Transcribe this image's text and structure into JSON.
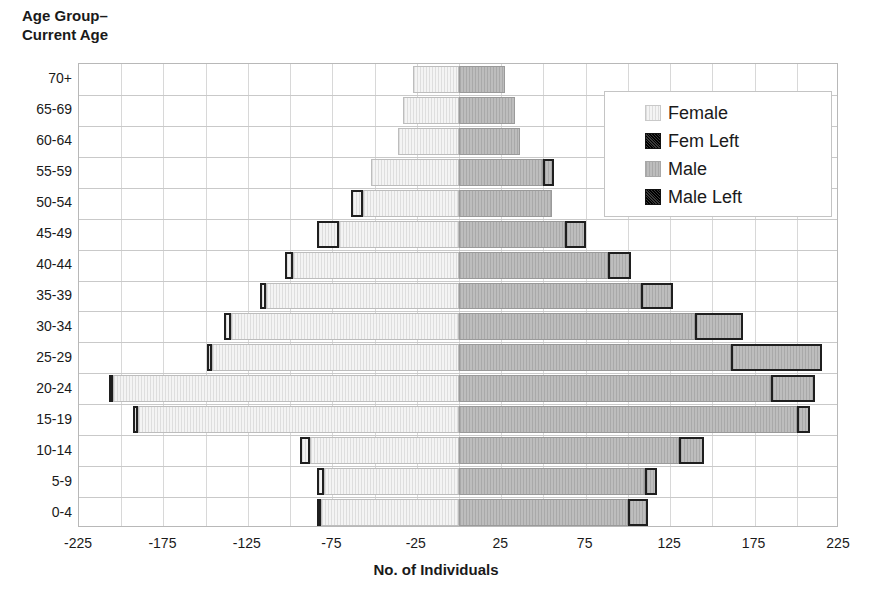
{
  "chart_data": {
    "type": "bar",
    "subtype": "population-pyramid",
    "title": "",
    "xlabel": "No. of Individuals",
    "ylabel": "Age Group–\nCurrent Age",
    "orientation": "horizontal",
    "grid": true,
    "legend_position": "top-right",
    "xlim": [
      -225,
      225
    ],
    "xticks": [
      -225,
      -175,
      -125,
      -75,
      -25,
      25,
      75,
      125,
      175,
      225
    ],
    "xtick_labels": [
      "-225",
      "-175",
      "-125",
      "-75",
      "-25",
      "25",
      "75",
      "125",
      "175",
      "225"
    ],
    "categories": [
      "70+",
      "65-69",
      "60-64",
      "55-59",
      "50-54",
      "45-49",
      "40-44",
      "35-39",
      "30-34",
      "25-29",
      "20-24",
      "15-19",
      "10-14",
      "5-9",
      "0-4"
    ],
    "series": [
      {
        "name": "Female",
        "side": "left",
        "color": "#ececec",
        "values": [
          -27,
          -33,
          -36,
          -52,
          -57,
          -71,
          -98,
          -114,
          -135,
          -146,
          -205,
          -190,
          -88,
          -80,
          -82
        ]
      },
      {
        "name": "Fem Left",
        "side": "left",
        "color": "#262626",
        "values": [
          0,
          0,
          0,
          0,
          -7,
          -13,
          -5,
          -4,
          -4,
          -3,
          -2,
          -3,
          -6,
          -4,
          -2
        ]
      },
      {
        "name": "Male",
        "side": "right",
        "color": "#b4b4b4",
        "values": [
          27,
          33,
          36,
          50,
          55,
          63,
          88,
          108,
          140,
          161,
          185,
          200,
          130,
          110,
          100
        ]
      },
      {
        "name": "Male Left",
        "side": "right",
        "color": "#262626",
        "values": [
          0,
          0,
          0,
          6,
          0,
          12,
          14,
          19,
          28,
          54,
          26,
          8,
          15,
          7,
          12
        ]
      }
    ]
  },
  "legend": {
    "items": [
      {
        "label": "Female",
        "swatch": "fem"
      },
      {
        "label": "Fem Left",
        "swatch": "femleft"
      },
      {
        "label": "Male",
        "swatch": "male"
      },
      {
        "label": "Male Left",
        "swatch": "maleleft"
      }
    ]
  }
}
